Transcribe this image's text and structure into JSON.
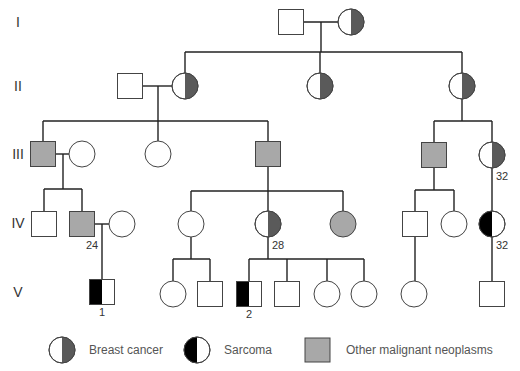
{
  "colors": {
    "breast_cancer": "#5a5a5a",
    "sarcoma": "#000000",
    "other_neoplasm": "#a8a8a8",
    "unaffected": "#ffffff",
    "line": "#222222"
  },
  "generations": [
    {
      "label": "I",
      "y": 22
    },
    {
      "label": "II",
      "y": 86
    },
    {
      "label": "III",
      "y": 154
    },
    {
      "label": "IV",
      "y": 223
    },
    {
      "label": "V",
      "y": 292
    }
  ],
  "individuals": [
    {
      "id": "I-1",
      "sex": "male",
      "x": 291,
      "y": 22,
      "status": "unaffected"
    },
    {
      "id": "I-2",
      "sex": "female",
      "x": 351,
      "y": 22,
      "status": "breast_cancer"
    },
    {
      "id": "II-1",
      "sex": "male",
      "x": 130,
      "y": 86,
      "status": "unaffected"
    },
    {
      "id": "II-2",
      "sex": "female",
      "x": 185,
      "y": 86,
      "status": "breast_cancer"
    },
    {
      "id": "II-3",
      "sex": "female",
      "x": 320,
      "y": 86,
      "status": "breast_cancer"
    },
    {
      "id": "II-4",
      "sex": "female",
      "x": 462,
      "y": 86,
      "status": "breast_cancer"
    },
    {
      "id": "III-1",
      "sex": "male",
      "x": 43,
      "y": 154,
      "status": "other_neoplasm"
    },
    {
      "id": "III-2",
      "sex": "female",
      "x": 82,
      "y": 154,
      "status": "unaffected"
    },
    {
      "id": "III-3",
      "sex": "female",
      "x": 158,
      "y": 154,
      "status": "unaffected"
    },
    {
      "id": "III-4",
      "sex": "male",
      "x": 268,
      "y": 154,
      "status": "other_neoplasm"
    },
    {
      "id": "III-5",
      "sex": "male",
      "x": 434,
      "y": 155,
      "status": "other_neoplasm"
    },
    {
      "id": "III-6",
      "sex": "female",
      "x": 492,
      "y": 155,
      "status": "breast_cancer",
      "age": "32"
    },
    {
      "id": "IV-1",
      "sex": "male",
      "x": 44,
      "y": 224,
      "status": "unaffected"
    },
    {
      "id": "IV-2",
      "sex": "male",
      "x": 82,
      "y": 224,
      "status": "other_neoplasm",
      "age": "24"
    },
    {
      "id": "IV-3",
      "sex": "female",
      "x": 122,
      "y": 224,
      "status": "unaffected"
    },
    {
      "id": "IV-4",
      "sex": "female",
      "x": 191,
      "y": 224,
      "status": "unaffected"
    },
    {
      "id": "IV-5",
      "sex": "female",
      "x": 268,
      "y": 224,
      "status": "breast_cancer",
      "age": "28"
    },
    {
      "id": "IV-6",
      "sex": "female",
      "x": 343,
      "y": 224,
      "status": "other_neoplasm"
    },
    {
      "id": "IV-7",
      "sex": "male",
      "x": 415,
      "y": 224,
      "status": "unaffected"
    },
    {
      "id": "IV-8",
      "sex": "female",
      "x": 454,
      "y": 224,
      "status": "unaffected"
    },
    {
      "id": "IV-9",
      "sex": "female",
      "x": 492,
      "y": 224,
      "status": "sarcoma",
      "age": "32"
    },
    {
      "id": "V-1",
      "sex": "male",
      "x": 102,
      "y": 292,
      "status": "sarcoma",
      "number": "1"
    },
    {
      "id": "V-2",
      "sex": "female",
      "x": 173,
      "y": 294,
      "status": "unaffected"
    },
    {
      "id": "V-3",
      "sex": "male",
      "x": 210,
      "y": 294,
      "status": "unaffected"
    },
    {
      "id": "V-4",
      "sex": "male",
      "x": 249,
      "y": 294,
      "status": "sarcoma",
      "number": "2"
    },
    {
      "id": "V-5",
      "sex": "male",
      "x": 287,
      "y": 294,
      "status": "unaffected"
    },
    {
      "id": "V-6",
      "sex": "female",
      "x": 327,
      "y": 294,
      "status": "unaffected"
    },
    {
      "id": "V-7",
      "sex": "female",
      "x": 364,
      "y": 294,
      "status": "unaffected"
    },
    {
      "id": "V-8",
      "sex": "female",
      "x": 414,
      "y": 294,
      "status": "unaffected"
    },
    {
      "id": "V-9",
      "sex": "male",
      "x": 492,
      "y": 294,
      "status": "unaffected"
    }
  ],
  "lines": [
    [
      304,
      22,
      338,
      22
    ],
    [
      321,
      22,
      321,
      52
    ],
    [
      185,
      52,
      462,
      52
    ],
    [
      185,
      52,
      185,
      73
    ],
    [
      320,
      52,
      320,
      73
    ],
    [
      462,
      52,
      462,
      73
    ],
    [
      143,
      86,
      172,
      86
    ],
    [
      158,
      86,
      158,
      121
    ],
    [
      43,
      121,
      268,
      121
    ],
    [
      43,
      121,
      43,
      142
    ],
    [
      158,
      121,
      158,
      141
    ],
    [
      268,
      121,
      268,
      142
    ],
    [
      462,
      99,
      462,
      121
    ],
    [
      434,
      121,
      492,
      121
    ],
    [
      434,
      121,
      434,
      143
    ],
    [
      492,
      121,
      492,
      142
    ],
    [
      56,
      154,
      69,
      154
    ],
    [
      63,
      154,
      63,
      189
    ],
    [
      44,
      189,
      82,
      189
    ],
    [
      44,
      189,
      44,
      212
    ],
    [
      82,
      189,
      82,
      212
    ],
    [
      268,
      167,
      268,
      191
    ],
    [
      191,
      191,
      343,
      191
    ],
    [
      191,
      191,
      191,
      211
    ],
    [
      268,
      191,
      268,
      211
    ],
    [
      343,
      191,
      343,
      211
    ],
    [
      434,
      167,
      434,
      190
    ],
    [
      415,
      190,
      454,
      190
    ],
    [
      415,
      190,
      415,
      212
    ],
    [
      454,
      190,
      454,
      211
    ],
    [
      492,
      168,
      492,
      211
    ],
    [
      95,
      224,
      109,
      224
    ],
    [
      102,
      224,
      102,
      280
    ],
    [
      191,
      237,
      191,
      259
    ],
    [
      173,
      259,
      210,
      259
    ],
    [
      173,
      259,
      173,
      281
    ],
    [
      210,
      259,
      210,
      282
    ],
    [
      268,
      237,
      268,
      259
    ],
    [
      249,
      259,
      364,
      259
    ],
    [
      249,
      259,
      249,
      282
    ],
    [
      287,
      259,
      287,
      282
    ],
    [
      327,
      259,
      327,
      281
    ],
    [
      364,
      259,
      364,
      281
    ],
    [
      415,
      236,
      415,
      281
    ],
    [
      492,
      237,
      492,
      282
    ]
  ],
  "legend": {
    "breast_cancer": "Breast cancer",
    "sarcoma": "Sarcoma",
    "other_neoplasm": "Other malignant neoplasms"
  }
}
